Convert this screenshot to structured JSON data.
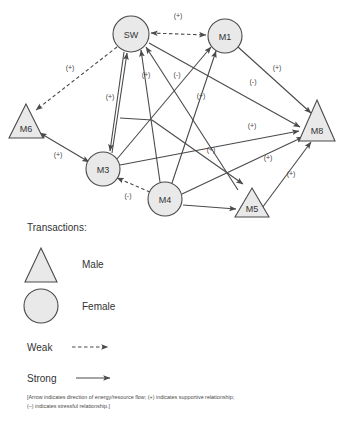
{
  "diagram": {
    "nodes": [
      {
        "id": "SW",
        "label": "SW",
        "shape": "circle",
        "cx": 131,
        "cy": 34,
        "r": 18
      },
      {
        "id": "M1",
        "label": "M1",
        "shape": "circle",
        "cx": 225,
        "cy": 36,
        "r": 17
      },
      {
        "id": "M6",
        "label": "M6",
        "shape": "triangle",
        "cx": 26,
        "cy": 122,
        "w": 34,
        "h": 34
      },
      {
        "id": "M8",
        "label": "M8",
        "shape": "triangle",
        "cx": 317,
        "cy": 121,
        "w": 36,
        "h": 41
      },
      {
        "id": "M3",
        "label": "M3",
        "shape": "circle",
        "cx": 103,
        "cy": 169,
        "r": 17
      },
      {
        "id": "M4",
        "label": "M4",
        "shape": "circle",
        "cx": 165,
        "cy": 199,
        "r": 17
      },
      {
        "id": "M5",
        "label": "M5",
        "shape": "triangle",
        "cx": 252,
        "cy": 203,
        "w": 34,
        "h": 30
      }
    ],
    "edges": [
      {
        "from": "SW",
        "to": "M1",
        "style": "weak",
        "arrows": "both",
        "sign": "(+)",
        "lx": 178,
        "ly": 18
      },
      {
        "from": "SW",
        "to": "M6",
        "style": "weak",
        "arrows": "to",
        "sign": "(+)",
        "lx": 70,
        "ly": 70
      },
      {
        "from": "SW",
        "to": "M3",
        "style": "strong",
        "arrows": "to",
        "sign": "(+)",
        "lx": 110,
        "ly": 99
      },
      {
        "from": "M3",
        "to": "SW",
        "style": "strong",
        "arrows": "to",
        "sign": "(+)",
        "lx": 146,
        "ly": 77
      },
      {
        "from": "M4",
        "to": "SW",
        "style": "strong",
        "arrows": "to",
        "sign": "(-)",
        "lx": 177,
        "ly": 77
      },
      {
        "from": "M3",
        "to": "M1",
        "style": "strong",
        "arrows": "to",
        "sign": "(+)",
        "lx": 201,
        "ly": 98
      },
      {
        "from": "M4",
        "to": "M1",
        "style": "strong",
        "arrows": "to",
        "sign": "",
        "lx": 0,
        "ly": 0
      },
      {
        "from": "M1",
        "to": "M8",
        "style": "strong",
        "arrows": "to",
        "sign": "(+)",
        "lx": 277,
        "ly": 70
      },
      {
        "from": "SW",
        "to": "M8",
        "style": "strong",
        "arrows": "to",
        "sign": "(-)",
        "lx": 253,
        "ly": 84
      },
      {
        "from": "M6",
        "to": "M3",
        "style": "strong",
        "arrows": "both",
        "sign": "(+)",
        "lx": 58,
        "ly": 157
      },
      {
        "from": "M3",
        "to": "M8",
        "style": "strong",
        "arrows": "to",
        "sign": "(+)",
        "lx": 252,
        "ly": 128
      },
      {
        "from": "M4",
        "to": "M8",
        "style": "strong",
        "arrows": "to",
        "sign": "(+)",
        "lx": 268,
        "ly": 160
      },
      {
        "from": "SW",
        "to": "M5",
        "style": "strong",
        "arrows": "to",
        "sign": "(+)",
        "lx": 211,
        "ly": 152
      },
      {
        "from": "M5",
        "to": "M8",
        "style": "strong",
        "arrows": "to",
        "sign": "(+)",
        "lx": 291,
        "ly": 176
      },
      {
        "from": "M4",
        "to": "M3",
        "style": "weak",
        "arrows": "to",
        "sign": "(-)",
        "lx": 128,
        "ly": 198
      },
      {
        "from": "M4",
        "to": "M5",
        "style": "strong",
        "arrows": "to",
        "sign": "",
        "lx": 0,
        "ly": 0
      }
    ]
  },
  "legend": {
    "title": "Transactions:",
    "male_label": "Male",
    "female_label": "Female",
    "weak_label": "Weak",
    "strong_label": "Strong",
    "footnote_line1": "[Arrow indicates direction of energy/resource flow; (+) indicates supportive relationship;",
    "footnote_line2": "(–) indicates stressful relationship.]"
  },
  "colors": {
    "shape_fill": "#e9e9e9",
    "stroke": "#4a4a4a",
    "text": "#333333",
    "background": "#ffffff"
  }
}
